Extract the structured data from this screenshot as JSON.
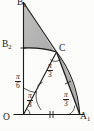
{
  "figure": {
    "kind": "geometry-diagram",
    "background_color": "#fdfdfc",
    "stroke_color": "#1a1a1a",
    "shade_color": "#9e9e9e",
    "points": [
      {
        "id": "B1",
        "label": "B",
        "sub": "1",
        "x": 24,
        "y": 2
      },
      {
        "id": "B2",
        "label": "B",
        "sub": "2",
        "x": 5,
        "y": 45
      },
      {
        "id": "C",
        "label": "C",
        "sub": "",
        "x": 56,
        "y": 49
      },
      {
        "id": "O",
        "label": "O",
        "sub": "",
        "x": 4,
        "y": 117
      },
      {
        "id": "A1",
        "label": "A",
        "sub": "1",
        "x": 80,
        "y": 114
      }
    ],
    "angles": [
      {
        "id": "angle-at-O-upper",
        "num": "π",
        "den": "6",
        "x": 17,
        "y": 76
      },
      {
        "id": "angle-at-O-lower",
        "num": "π",
        "den": "3",
        "x": 27,
        "y": 95
      },
      {
        "id": "angle-at-C",
        "num": "π",
        "den": "3",
        "x": 44,
        "y": 63
      },
      {
        "id": "angle-at-A1",
        "num": "π",
        "den": "3",
        "x": 62,
        "y": 92
      }
    ],
    "shaded_regions": [
      {
        "id": "upper-region",
        "description": "region bounded by axis B1-B2, arc B2-C and chord C-B1"
      },
      {
        "id": "lower-region",
        "description": "lens region bounded by chord C-A1 and arc C-A1"
      }
    ],
    "tick_marks": [
      {
        "id": "tick-OC",
        "count": 1,
        "segment": "O-C"
      },
      {
        "id": "tick-OA1",
        "count": 2,
        "segment": "O-A1"
      },
      {
        "id": "tick-CA1",
        "count": 1,
        "segment": "C-A1"
      }
    ],
    "axes": {
      "vertical": {
        "id": "vertical-axis",
        "from": "O",
        "to": "B1"
      },
      "horizontal": {
        "id": "horizontal-axis",
        "from": "O",
        "to": "A1"
      }
    }
  }
}
